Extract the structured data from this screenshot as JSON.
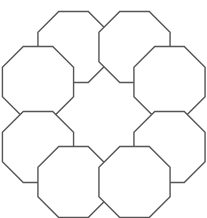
{
  "figure": {
    "type": "geometric-diagram",
    "shape_name": "regular-octagon",
    "tile_count": 8,
    "arrangement": "3x3 grid ring with empty center",
    "background_color": "#ffffff",
    "stroke_color": "#555555",
    "fill_color": "#ffffff",
    "stroke_width": 1.4,
    "canvas": {
      "width": 207,
      "height": 218
    },
    "geometry": {
      "center_x": 103.5,
      "center_y": 109,
      "pitch_x": 65.5,
      "pitch_y": 71,
      "circumradius": 38.5,
      "orientation": "flat-top",
      "rotation_deg": 22.5
    },
    "tiles": [
      {
        "name": "octagon-top-left",
        "col": -1,
        "row": -1,
        "cx": 73.5,
        "cy": 47.0
      },
      {
        "name": "octagon-top-right",
        "col": 1,
        "row": -1,
        "cx": 134.5,
        "cy": 47.0
      },
      {
        "name": "octagon-middle-left",
        "col": -2,
        "row": 0,
        "cx": 38.0,
        "cy": 82.0
      },
      {
        "name": "octagon-middle-right",
        "col": 2,
        "row": 0,
        "cx": 169.5,
        "cy": 82.0
      },
      {
        "name": "octagon-lower-left",
        "col": -2,
        "row": 1,
        "cx": 38.0,
        "cy": 147.0
      },
      {
        "name": "octagon-lower-right",
        "col": 2,
        "row": 1,
        "cx": 169.5,
        "cy": 147.0
      },
      {
        "name": "octagon-bottom-left",
        "col": -1,
        "row": 2,
        "cx": 73.5,
        "cy": 182.0
      },
      {
        "name": "octagon-bottom-right",
        "col": 1,
        "row": 2,
        "cx": 134.5,
        "cy": 182.0
      }
    ],
    "void": {
      "name": "central-void",
      "description": "square region with notched corners at the centre of the ring",
      "cx": 103.5,
      "cy": 112.0
    }
  }
}
